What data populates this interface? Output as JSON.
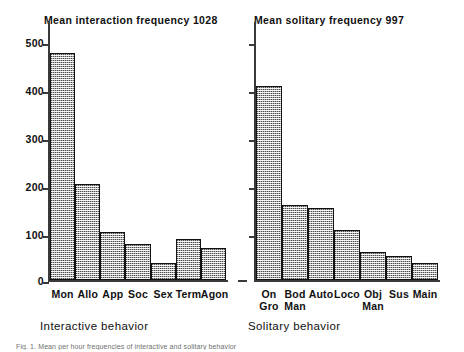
{
  "figure": {
    "caption": "Fig. 1. Mean per hour frequencies of interactive and solitary behavior"
  },
  "panels": [
    {
      "id": "left",
      "title": "Mean interaction frequency 1028",
      "axis_title": "Interactive behavior"
    },
    {
      "id": "right",
      "title": "Mean solitary frequency 997",
      "axis_title": "Solitary behavior"
    }
  ],
  "y_axis": {
    "ticks": [
      {
        "value": 500,
        "label": "500"
      },
      {
        "value": 400,
        "label": "400"
      },
      {
        "value": 300,
        "label": "300"
      },
      {
        "value": 200,
        "label": "200"
      },
      {
        "value": 100,
        "label": "100"
      },
      {
        "value": 0,
        "label": "0"
      }
    ]
  },
  "colors": {
    "bar_fill": "#4d4d4d",
    "bar_border": "#111111",
    "axis": "#3a3a3a",
    "text": "#101010",
    "background": "#ffffff"
  },
  "chart_data": [
    {
      "type": "bar",
      "title": "Mean interaction frequency 1028",
      "xlabel": "Interactive behavior",
      "ylabel": "",
      "ylim": [
        0,
        520
      ],
      "yticks": [
        0,
        100,
        200,
        300,
        400,
        500
      ],
      "grid": false,
      "legend": "none",
      "categories": [
        "Mon",
        "Allo",
        "App",
        "Soc",
        "Sex",
        "Term",
        "Agon"
      ],
      "category_lines": [
        [
          "Mon",
          ""
        ],
        [
          "Allo",
          ""
        ],
        [
          "App",
          ""
        ],
        [
          "Soc",
          ""
        ],
        [
          "Sex",
          ""
        ],
        [
          "Term",
          ""
        ],
        [
          "Agon",
          ""
        ]
      ],
      "values": [
        473,
        201,
        99,
        74,
        36,
        85,
        66
      ],
      "annotations": [
        "Mean interaction frequency 1028"
      ]
    },
    {
      "type": "bar",
      "title": "Mean solitary frequency 997",
      "xlabel": "Solitary behavior",
      "ylabel": "",
      "ylim": [
        0,
        520
      ],
      "yticks": [
        0,
        100,
        200,
        300,
        400,
        500
      ],
      "ytick_labels_visible": false,
      "grid": false,
      "legend": "none",
      "categories": [
        "On Gro",
        "Bod Man",
        "Auto",
        "Loco",
        "Obj Man",
        "Sus",
        "Main"
      ],
      "category_lines": [
        [
          "On",
          "Gro"
        ],
        [
          "Bod",
          "Man"
        ],
        [
          "Auto",
          ""
        ],
        [
          "Loco",
          ""
        ],
        [
          "Obj",
          "Man"
        ],
        [
          "Sus",
          ""
        ],
        [
          "Main",
          ""
        ]
      ],
      "values": [
        405,
        157,
        151,
        105,
        58,
        50,
        35
      ],
      "annotations": [
        "Mean solitary frequency 997"
      ]
    }
  ]
}
